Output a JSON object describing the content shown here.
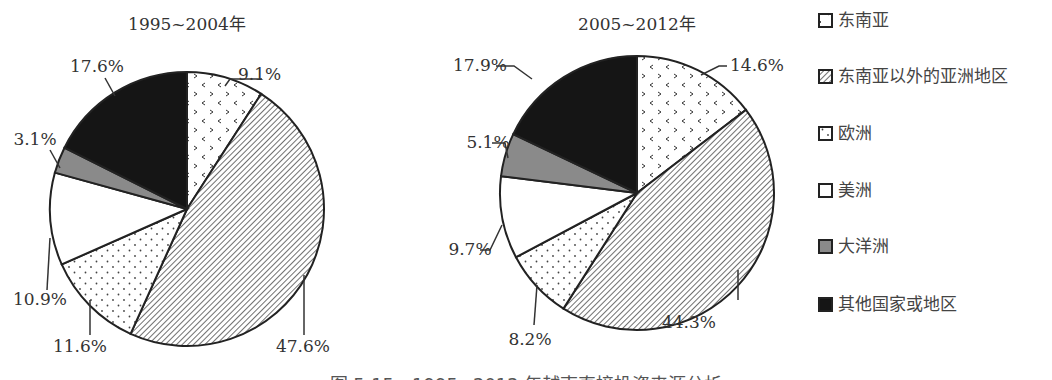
{
  "chart_data": [
    {
      "type": "pie",
      "title": "1995~2004年",
      "categories": [
        "东南亚",
        "东南亚以外的亚洲地区",
        "欧洲",
        "美洲",
        "大洋洲",
        "其他国家或地区"
      ],
      "values": [
        9.1,
        47.6,
        11.6,
        10.9,
        3.1,
        17.6
      ],
      "labels": [
        "9.1%",
        "47.6%",
        "11.6%",
        "10.9%",
        "3.1%",
        "17.6%"
      ],
      "start": "12 o'clock",
      "direction": "clockwise"
    },
    {
      "type": "pie",
      "title": "2005~2012年",
      "categories": [
        "东南亚",
        "东南亚以外的亚洲地区",
        "欧洲",
        "美洲",
        "大洋洲",
        "其他国家或地区"
      ],
      "values": [
        14.6,
        44.3,
        8.2,
        9.7,
        5.1,
        17.9
      ],
      "labels": [
        "14.6%",
        "44.3%",
        "8.2%",
        "9.7%",
        "5.1%",
        "17.9%"
      ],
      "start": "12 o'clock",
      "direction": "clockwise"
    }
  ],
  "legend": {
    "placement": "right",
    "items": [
      {
        "label": "东南亚",
        "pattern": "chevrons"
      },
      {
        "label": "东南亚以外的亚洲地区",
        "pattern": "diagonal-hatch"
      },
      {
        "label": "欧洲",
        "pattern": "dots"
      },
      {
        "label": "美洲",
        "pattern": "white"
      },
      {
        "label": "大洋洲",
        "pattern": "gray"
      },
      {
        "label": "其他国家或地区",
        "pattern": "black"
      }
    ]
  },
  "colors": {
    "outline": "#222222",
    "gray": "#8a8a8a",
    "black": "#151515",
    "white": "#ffffff"
  },
  "caption": "图 5-15　1995~2012 年越南直接投资来源分析"
}
